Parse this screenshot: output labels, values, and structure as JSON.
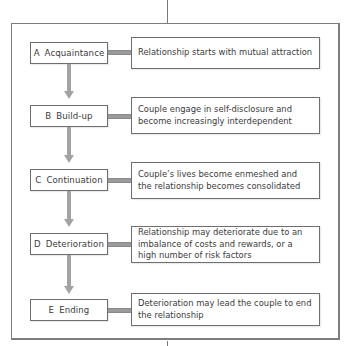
{
  "diagram": {
    "type": "flowchart",
    "title": "",
    "colors": {
      "box_border": "#6e6e6e",
      "arrow": "#a3a3a3",
      "frame": "#7d7d7d",
      "text": "#3a3a3a"
    },
    "stages": [
      {
        "letter": "A",
        "name": "Acquaintance",
        "description": "Relationship starts with mutual attraction"
      },
      {
        "letter": "B",
        "name": "Build-up",
        "description": "Couple engage in self-disclosure and become increasingly interdependent"
      },
      {
        "letter": "C",
        "name": "Continuation",
        "description": "Couple’s lives become enmeshed and the relationship becomes consolidated"
      },
      {
        "letter": "D",
        "name": "Deterioration",
        "description": "Relationship may deteriorate due to an imbalance of costs and rewards, or a high number of risk factors"
      },
      {
        "letter": "E",
        "name": "Ending",
        "description": "Deterioration may lead the couple to end the relationship"
      }
    ],
    "edges": [
      {
        "from": "A",
        "to": "B"
      },
      {
        "from": "B",
        "to": "C"
      },
      {
        "from": "C",
        "to": "D"
      },
      {
        "from": "D",
        "to": "E"
      }
    ]
  }
}
